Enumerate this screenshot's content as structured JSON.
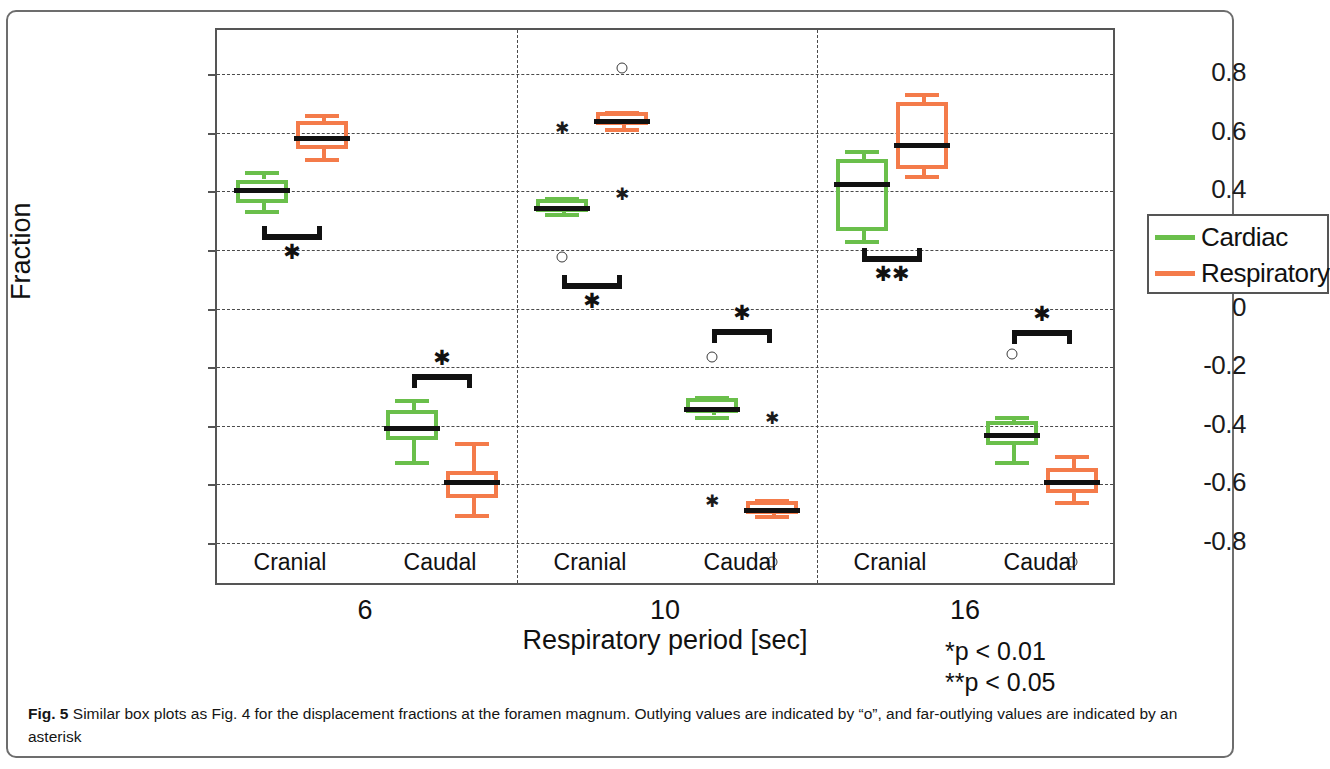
{
  "figure": {
    "caption_label": "Fig. 5",
    "caption_text": "Similar box plots as Fig. 4 for the displacement fractions at the foramen magnum. Outlying values are indicated by “o”, and far-outlying values are indicated by an asterisk"
  },
  "axes": {
    "ylabel": "Fraction",
    "xlabel": "Respiratory period [sec]",
    "yticks": [
      0.8,
      0.6,
      0.4,
      0.2,
      0,
      -0.2,
      -0.4,
      -0.6,
      -0.8
    ],
    "ytick_labels": [
      "0.8",
      "0.6",
      "0.4",
      "0.2",
      "0",
      "-0.2",
      "-0.4",
      "-0.6",
      "-0.8"
    ],
    "ylim": [
      -0.95,
      0.95
    ]
  },
  "legend": {
    "position": "right-middle",
    "entries": [
      {
        "label": "Cardiac",
        "color": "#6abf4b"
      },
      {
        "label": "Respiratory",
        "color": "#f47b4a"
      }
    ]
  },
  "significance_note": {
    "line1": "*p < 0.01",
    "line2": "**p < 0.05"
  },
  "chart_data": {
    "type": "box",
    "title": "",
    "xlabel": "Respiratory period [sec]",
    "ylabel": "Fraction",
    "ylim": [
      -0.95,
      0.95
    ],
    "yticks": [
      0.8,
      0.6,
      0.4,
      0.2,
      0,
      -0.2,
      -0.4,
      -0.6,
      -0.8
    ],
    "grid": "horizontal-dashed",
    "legend_position": "right-middle",
    "groups": [
      "6",
      "10",
      "16"
    ],
    "group_label": "Respiratory period [sec]",
    "subgroups": [
      "Cranial",
      "Caudal"
    ],
    "series": [
      {
        "name": "Cardiac",
        "color": "#6abf4b"
      },
      {
        "name": "Respiratory",
        "color": "#f47b4a"
      }
    ],
    "boxes": [
      {
        "group": "6",
        "subgroup": "Cranial",
        "series": "Cardiac",
        "whisker_low": 0.335,
        "q1": 0.36,
        "median": 0.41,
        "q3": 0.44,
        "whisker_high": 0.47,
        "outliers": [],
        "far_outliers": []
      },
      {
        "group": "6",
        "subgroup": "Cranial",
        "series": "Respiratory",
        "whisker_low": 0.515,
        "q1": 0.545,
        "median": 0.59,
        "q3": 0.64,
        "whisker_high": 0.665,
        "outliers": [],
        "far_outliers": []
      },
      {
        "group": "6",
        "subgroup": "Caudal",
        "series": "Cardiac",
        "whisker_low": -0.52,
        "q1": -0.45,
        "median": -0.4,
        "q3": -0.345,
        "whisker_high": -0.31,
        "outliers": [],
        "far_outliers": []
      },
      {
        "group": "6",
        "subgroup": "Caudal",
        "series": "Respiratory",
        "whisker_low": -0.7,
        "q1": -0.645,
        "median": -0.585,
        "q3": -0.555,
        "whisker_high": -0.455,
        "outliers": [],
        "far_outliers": []
      },
      {
        "group": "10",
        "subgroup": "Cranial",
        "series": "Cardiac",
        "whisker_low": 0.325,
        "q1": 0.33,
        "median": 0.35,
        "q3": 0.375,
        "whisker_high": 0.38,
        "outliers": [
          0.175
        ],
        "far_outliers": [
          0.615
        ]
      },
      {
        "group": "10",
        "subgroup": "Cranial",
        "series": "Respiratory",
        "whisker_low": 0.615,
        "q1": 0.625,
        "median": 0.645,
        "q3": 0.67,
        "whisker_high": 0.675,
        "outliers": [
          0.82
        ],
        "far_outliers": [
          0.39
        ]
      },
      {
        "group": "10",
        "subgroup": "Caudal",
        "series": "Cardiac",
        "whisker_low": -0.365,
        "q1": -0.355,
        "median": -0.335,
        "q3": -0.305,
        "whisker_high": -0.3,
        "outliers": [
          -0.165
        ],
        "far_outliers": [
          -0.655
        ]
      },
      {
        "group": "10",
        "subgroup": "Caudal",
        "series": "Respiratory",
        "whisker_low": -0.705,
        "q1": -0.7,
        "median": -0.68,
        "q3": -0.655,
        "whisker_high": -0.65,
        "outliers": [
          -0.865
        ],
        "far_outliers": [
          -0.375
        ]
      },
      {
        "group": "16",
        "subgroup": "Cranial",
        "series": "Cardiac",
        "whisker_low": 0.235,
        "q1": 0.265,
        "median": 0.43,
        "q3": 0.51,
        "whisker_high": 0.54,
        "outliers": [],
        "far_outliers": []
      },
      {
        "group": "16",
        "subgroup": "Cranial",
        "series": "Respiratory",
        "whisker_low": 0.455,
        "q1": 0.475,
        "median": 0.565,
        "q3": 0.705,
        "whisker_high": 0.735,
        "outliers": [],
        "far_outliers": []
      },
      {
        "group": "16",
        "subgroup": "Caudal",
        "series": "Cardiac",
        "whisker_low": -0.52,
        "q1": -0.465,
        "median": -0.425,
        "q3": -0.385,
        "whisker_high": -0.365,
        "outliers": [
          -0.155
        ],
        "far_outliers": []
      },
      {
        "group": "16",
        "subgroup": "Caudal",
        "series": "Respiratory",
        "whisker_low": -0.655,
        "q1": -0.63,
        "median": -0.585,
        "q3": -0.545,
        "whisker_high": -0.5,
        "outliers": [
          -0.865
        ],
        "far_outliers": []
      }
    ],
    "significance_brackets": [
      {
        "group": "6",
        "subgroup": "Cranial",
        "y": 0.28,
        "marker": "*",
        "label_below": true
      },
      {
        "group": "6",
        "subgroup": "Caudal",
        "y": -0.225,
        "marker": "*",
        "label_below": false
      },
      {
        "group": "10",
        "subgroup": "Cranial",
        "y": 0.115,
        "marker": "*",
        "label_below": true
      },
      {
        "group": "10",
        "subgroup": "Caudal",
        "y": -0.07,
        "marker": "*",
        "label_below": false
      },
      {
        "group": "16",
        "subgroup": "Cranial",
        "y": 0.205,
        "marker": "**",
        "label_below": true
      },
      {
        "group": "16",
        "subgroup": "Caudal",
        "y": -0.075,
        "marker": "*",
        "label_below": false
      }
    ],
    "annotations": [
      "*p < 0.01",
      "**p < 0.05"
    ]
  }
}
